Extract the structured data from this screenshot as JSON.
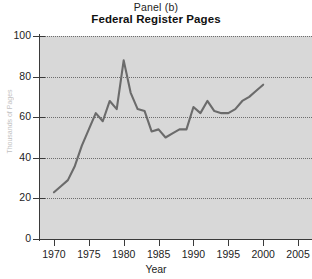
{
  "figure": {
    "panel_label": "Panel (b)",
    "title": "Federal Register Pages",
    "xaxis_title": "Year",
    "yaxis_title": "Thousands of Pages"
  },
  "chart_data": {
    "type": "line",
    "title": "Federal Register Pages",
    "subtitle": "Panel (b)",
    "xlabel": "Year",
    "ylabel": "Thousands of Pages",
    "xlim": [
      1968,
      2007
    ],
    "ylim": [
      0,
      100
    ],
    "xticks": [
      1970,
      1975,
      1980,
      1985,
      1990,
      1995,
      2000,
      2005
    ],
    "yticks": [
      0,
      20,
      40,
      60,
      80,
      100
    ],
    "grid": "horizontal-dotted",
    "legend": "none",
    "line_color": "#6b6b6b",
    "plot_background": "#d8d8d8",
    "series": [
      {
        "name": "Federal Register Pages",
        "x": [
          1970,
          1971,
          1972,
          1973,
          1974,
          1975,
          1976,
          1977,
          1978,
          1979,
          1980,
          1981,
          1982,
          1983,
          1984,
          1985,
          1986,
          1987,
          1988,
          1989,
          1990,
          1991,
          1992,
          1993,
          1994,
          1995,
          1996,
          1997,
          1998,
          1999,
          2000
        ],
        "values": [
          23,
          26,
          29,
          36,
          46,
          54,
          62,
          58,
          68,
          64,
          88,
          72,
          64,
          63,
          53,
          54,
          50,
          52,
          54,
          54,
          65,
          62,
          68,
          63,
          62,
          62,
          64,
          68,
          70,
          73,
          76
        ]
      }
    ]
  }
}
